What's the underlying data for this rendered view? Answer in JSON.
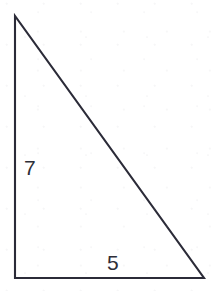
{
  "figure": {
    "kind": "right-triangle-diagram",
    "background_color": "#ffffff",
    "ink_color": "#2b2b38",
    "label_color": "#2e2e38",
    "canvas": {
      "width": 216,
      "height": 291
    }
  },
  "chart_data": {
    "type": "diagram",
    "title": "",
    "shape": "right triangle",
    "vertices": [
      {
        "name": "apex",
        "x": 15,
        "y": 16
      },
      {
        "name": "bottom-left",
        "x": 15,
        "y": 278
      },
      {
        "name": "bottom-right",
        "x": 204,
        "y": 278
      }
    ],
    "edges": [
      {
        "name": "vertical-leg",
        "from": "apex",
        "to": "bottom-left",
        "label": "7"
      },
      {
        "name": "horizontal-leg",
        "from": "bottom-left",
        "to": "bottom-right",
        "label": "5"
      },
      {
        "name": "hypotenuse",
        "from": "apex",
        "to": "bottom-right",
        "label": ""
      }
    ],
    "right_angle_at": "bottom-left",
    "labels": [
      {
        "name": "vertical-leg-label",
        "text": "7",
        "x": 24,
        "y": 157
      },
      {
        "name": "horizontal-leg-label",
        "text": "5",
        "x": 107,
        "y": 252
      }
    ],
    "xlabel": "",
    "ylabel": "",
    "grid": false,
    "legend": false
  },
  "labels": {
    "vertical_leg": "7",
    "horizontal_leg": "5"
  },
  "geometry": {
    "apex": {
      "x": 15,
      "y": 16
    },
    "bottom_left": {
      "x": 15,
      "y": 278
    },
    "bottom_right": {
      "x": 204,
      "y": 278
    },
    "path": "M 15 16 L 15 278 L 204 278 Z"
  }
}
